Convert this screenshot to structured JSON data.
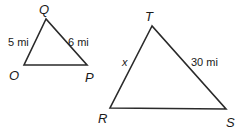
{
  "diagram": {
    "type": "similar-triangles",
    "triangles": [
      {
        "name": "OQP",
        "vertices": [
          {
            "label": "Q",
            "x": 46,
            "y": 19,
            "label_x": 44,
            "label_y": 15
          },
          {
            "label": "O",
            "x": 24,
            "y": 65,
            "label_x": 15,
            "label_y": 80
          },
          {
            "label": "P",
            "x": 87,
            "y": 65,
            "label_x": 90,
            "label_y": 82
          }
        ],
        "sides": [
          {
            "between": "O-Q",
            "label": "5 mi",
            "label_x": 7,
            "label_y": 46
          },
          {
            "between": "Q-P",
            "label": "6 mi",
            "label_x": 68,
            "label_y": 46
          }
        ]
      },
      {
        "name": "RTS",
        "vertices": [
          {
            "label": "T",
            "x": 152,
            "y": 26,
            "label_x": 150,
            "label_y": 21
          },
          {
            "label": "R",
            "x": 110,
            "y": 108,
            "label_x": 103,
            "label_y": 124
          },
          {
            "label": "S",
            "x": 226,
            "y": 109,
            "label_x": 231,
            "label_y": 127
          }
        ],
        "sides": [
          {
            "between": "R-T",
            "label": "x",
            "label_x": 122,
            "label_y": 66
          },
          {
            "between": "T-S",
            "label": "30 mi",
            "label_x": 191,
            "label_y": 66
          }
        ]
      }
    ],
    "colors": {
      "stroke": "#2a2a2a",
      "text": "#1a1a1a",
      "background": "#ffffff"
    }
  }
}
